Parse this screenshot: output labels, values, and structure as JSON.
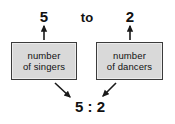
{
  "diagram": {
    "top_row": {
      "left_number": "5",
      "connector": "to",
      "right_number": "2"
    },
    "boxes": [
      {
        "name": "singers",
        "line1": "number",
        "line2": "of singers"
      },
      {
        "name": "dancers",
        "line1": "number",
        "line2": "of dancers"
      }
    ],
    "result": "5 : 2",
    "arrows": [
      {
        "name": "arrow-up-to-five",
        "direction": "up"
      },
      {
        "name": "arrow-up-to-two",
        "direction": "up"
      },
      {
        "name": "arrow-down-right-to-result",
        "direction": "down-right"
      },
      {
        "name": "arrow-down-left-to-result",
        "direction": "down-left"
      }
    ],
    "colors": {
      "background": "#ffffff",
      "box_fill": "#d9d9d9",
      "box_border": "#3b3b3b",
      "text": "#111111",
      "arrow": "#1a1a1a"
    }
  }
}
